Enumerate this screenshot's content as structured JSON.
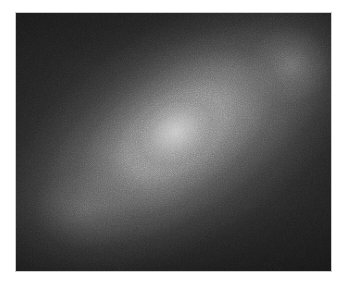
{
  "figure": {
    "kind": "grayscale-intensity-map",
    "caption": "",
    "background_color": "#ffffff"
  },
  "panel": {
    "name": "image-panel",
    "x": 15,
    "y": 12,
    "width": 317,
    "height": 260,
    "border_color": "#c9c9c9",
    "border_width_px": 1,
    "base_color": "#232323"
  },
  "chart_data": {
    "type": "heatmap",
    "title": "",
    "subtitle": "",
    "xlabel": "",
    "ylabel": "",
    "colormap": "grayscale",
    "grid": false,
    "legend": "none",
    "axis_ticks_visible": false,
    "value_unit": "relative intensity (8-bit gray level)",
    "value_range": [
      35,
      196
    ],
    "background_level": 35,
    "peak_level": 196,
    "noise": {
      "present": true,
      "character": "fine monochrome photographic grain",
      "approx_amplitude_gray_levels": 14
    },
    "features": [
      {
        "name": "primary-core",
        "label": "Bright compact core",
        "center_x_px": 175,
        "center_y_px": 133,
        "center_fraction": [
          0.505,
          0.465
        ],
        "peak_gray": 196,
        "peak_hex": "#c4c4c4",
        "semi_major_px": 26,
        "semi_minor_px": 22,
        "position_angle_deg": -30
      },
      {
        "name": "inner-halo",
        "label": "Elongated inner halo",
        "center_fraction": [
          0.5,
          0.47
        ],
        "peak_gray": 176,
        "peak_hex": "#b0b0b0",
        "semi_major_px": 82,
        "semi_minor_px": 52,
        "position_angle_deg": -36
      },
      {
        "name": "outer-halo",
        "label": "Diffuse outer halo",
        "center_fraction": [
          0.52,
          0.48
        ],
        "peak_gray": 160,
        "peak_hex": "#a0a0a0",
        "semi_major_px": 160,
        "semi_minor_px": 92,
        "position_angle_deg": -34
      },
      {
        "name": "secondary-lobe-upper-right",
        "label": "Secondary lobe, upper right",
        "center_x_px": 290,
        "center_y_px": 65,
        "center_fraction": [
          0.87,
          0.2
        ],
        "peak_gray": 132,
        "peak_hex": "#848484",
        "semi_major_px": 50,
        "semi_minor_px": 44
      },
      {
        "name": "tertiary-lobe-lower-left",
        "label": "Tertiary lobe, lower left",
        "center_x_px": 85,
        "center_y_px": 210,
        "center_fraction": [
          0.22,
          0.76
        ],
        "peak_gray": 112,
        "peak_hex": "#707070",
        "semi_major_px": 56,
        "semi_minor_px": 46
      }
    ],
    "corners": [
      {
        "name": "top-left",
        "gray": 38,
        "hex": "#262626"
      },
      {
        "name": "top-right",
        "gray": 44,
        "hex": "#2c2c2c"
      },
      {
        "name": "bottom-left",
        "gray": 35,
        "hex": "#232323"
      },
      {
        "name": "bottom-right",
        "gray": 33,
        "hex": "#212121"
      }
    ],
    "profile_along_major_axis": {
      "x_label": "offset along major axis (px)",
      "y_label": "gray level",
      "x": [
        -150,
        -120,
        -90,
        -60,
        -30,
        0,
        30,
        60,
        90,
        120,
        150
      ],
      "values": [
        40,
        52,
        70,
        104,
        156,
        196,
        150,
        112,
        96,
        104,
        82
      ]
    },
    "profile_along_minor_axis": {
      "x_label": "offset along minor axis (px)",
      "y_label": "gray level",
      "x": [
        -100,
        -75,
        -50,
        -25,
        0,
        25,
        50,
        75,
        100
      ],
      "values": [
        38,
        48,
        72,
        128,
        196,
        126,
        78,
        52,
        40
      ]
    }
  }
}
